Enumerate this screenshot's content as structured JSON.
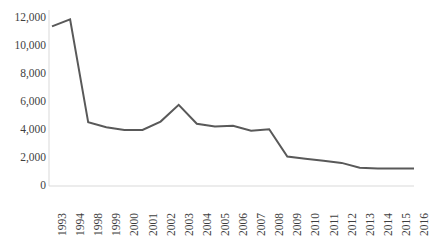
{
  "chart_data": {
    "type": "line",
    "title": "",
    "subtitle": "",
    "xlabel": "",
    "ylabel": "",
    "categories": [
      "1993",
      "1994",
      "1998",
      "1999",
      "2000",
      "2001",
      "2002",
      "2003",
      "2004",
      "2005",
      "2006",
      "2007",
      "2008",
      "2009",
      "2010",
      "2011",
      "2012",
      "2013",
      "2014",
      "2015",
      "2016"
    ],
    "series": [
      {
        "name": "",
        "color": "#595959",
        "values": [
          11400,
          11900,
          4550,
          4200,
          4000,
          4000,
          4600,
          5800,
          4450,
          4250,
          4300,
          3950,
          4050,
          2100,
          1950,
          1800,
          1650,
          1300,
          1250,
          1250,
          1250
        ]
      }
    ],
    "ylim": [
      0,
      12000
    ],
    "yticks": [
      0,
      2000,
      4000,
      6000,
      8000,
      10000,
      12000
    ],
    "ytick_labels": [
      "0",
      "2,000",
      "4,000",
      "6,000",
      "8,000",
      "10,000",
      "12,000"
    ],
    "grid": false,
    "legend": false,
    "legend_position": "none",
    "axis_line_color": "#d9d9d9",
    "tick_label_color": "#3f3f3f"
  },
  "axes": {
    "y_label_area_width": 46,
    "plot_left": 52,
    "plot_right": 414,
    "plot_top": 18,
    "plot_bottom": 186,
    "x_label_top": 192
  }
}
